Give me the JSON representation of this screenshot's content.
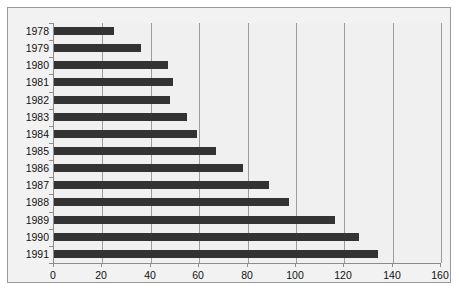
{
  "chart_data": {
    "type": "bar",
    "orientation": "horizontal",
    "title": "",
    "subtitle": "",
    "xlabel": "",
    "ylabel": "",
    "categories": [
      "1978",
      "1979",
      "1980",
      "1981",
      "1982",
      "1983",
      "1984",
      "1985",
      "1986",
      "1987",
      "1988",
      "1989",
      "1990",
      "1991"
    ],
    "values": [
      25,
      36,
      47,
      49,
      48,
      55,
      59,
      67,
      78,
      89,
      97,
      116,
      126,
      134
    ],
    "xlim": [
      0,
      160
    ],
    "xticks": [
      0,
      20,
      40,
      60,
      80,
      100,
      120,
      140,
      160
    ],
    "xtick_labels": [
      "0",
      "20",
      "40",
      "60",
      "80",
      "100",
      "120",
      "140",
      "160"
    ],
    "grid": "vertical",
    "legend": "none",
    "series": [
      {
        "name": "",
        "color": "#333333",
        "values": [
          25,
          36,
          47,
          49,
          48,
          55,
          59,
          67,
          78,
          89,
          97,
          116,
          126,
          134
        ]
      }
    ],
    "annotations": []
  },
  "style": {
    "bar_color": "#333333",
    "plot_background": "#f0f0f0",
    "frame_background": "#f2f2f2",
    "frame_border": "#9a9a9a",
    "gridline_color": "#9d9d9d",
    "axis_color": "#8c8c8c",
    "text_color": "#111111",
    "page_background": "#ffffff"
  }
}
